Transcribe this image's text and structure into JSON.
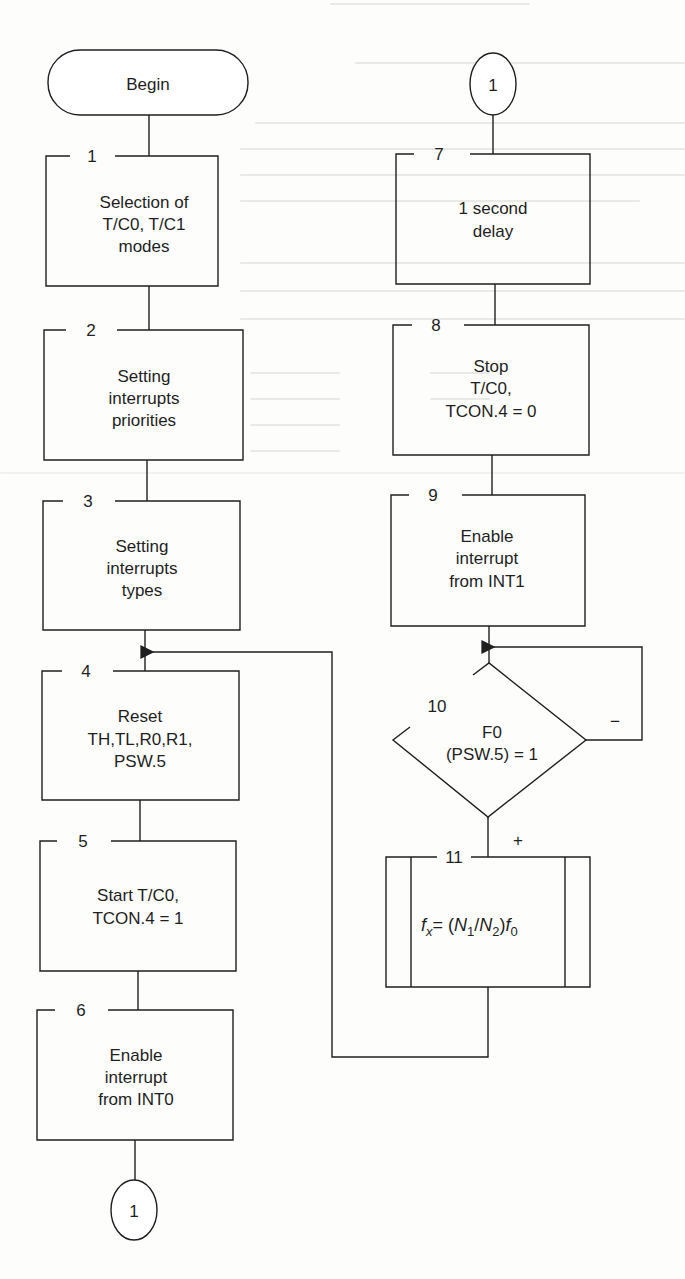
{
  "diagram": {
    "type": "flowchart",
    "colors": {
      "ink": "#1f1f1f",
      "paper": "#fdfdfc",
      "bleed_through": "#e9e9e6"
    },
    "terminal": {
      "label": "Begin"
    },
    "connectors": {
      "top_right": {
        "label": "1"
      },
      "bottom_left": {
        "label": "1"
      }
    },
    "steps": [
      {
        "id": "1",
        "lines": [
          "Selection of",
          "T/C0, T/C1",
          "modes"
        ]
      },
      {
        "id": "2",
        "lines": [
          "Setting",
          "interrupts",
          "priorities"
        ]
      },
      {
        "id": "3",
        "lines": [
          "Setting",
          "interrupts",
          "types"
        ]
      },
      {
        "id": "4",
        "lines": [
          "Reset",
          "TH,TL,R0,R1,",
          "PSW.5"
        ]
      },
      {
        "id": "5",
        "lines": [
          "Start T/C0,",
          "TCON.4 = 1"
        ]
      },
      {
        "id": "6",
        "lines": [
          "Enable",
          "interrupt",
          "from INT0"
        ]
      },
      {
        "id": "7",
        "lines": [
          "1 second",
          "delay"
        ]
      },
      {
        "id": "8",
        "lines": [
          "Stop",
          "T/C0,",
          "TCON.4 = 0"
        ]
      },
      {
        "id": "9",
        "lines": [
          "Enable",
          "interrupt",
          "from INT1"
        ]
      }
    ],
    "decision": {
      "id": "10",
      "lines": [
        "F0",
        "(PSW.5) = 1"
      ],
      "no_label": "−",
      "yes_label": "+"
    },
    "subroutine": {
      "id": "11",
      "formula": {
        "f": "f",
        "x_sub": "x",
        "eq": "= (",
        "n1": "N",
        "n1_sub": "1",
        "slash": "/",
        "n2": "N",
        "n2_sub": "2",
        "close": ")",
        "f0": "f",
        "f0_sub": "0"
      }
    }
  }
}
